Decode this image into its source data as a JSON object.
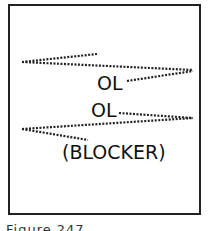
{
  "diagram": {
    "labels": {
      "ol_top": "OL",
      "ol_bottom": "OL",
      "blocker": "(BLOCKER)"
    },
    "caption": "Figure 247",
    "stroke_color": "#222222"
  }
}
